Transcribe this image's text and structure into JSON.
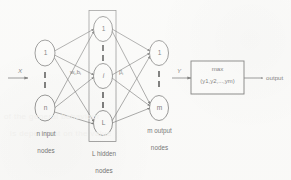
{
  "figure": {
    "background_color": "#fbfbfa",
    "stroke_color": "#2b2b2b"
  },
  "signals": {
    "input_label": "X",
    "hidden_to_output_label": "Y",
    "final_output_label": "output"
  },
  "layers": {
    "input": {
      "caption_line1": "n input",
      "caption_line2": "nodes",
      "nodes": [
        {
          "label": "1"
        },
        {
          "label": "n"
        }
      ],
      "ellipsis": "vertical-dashed"
    },
    "hidden": {
      "caption_line1": "L  hidden",
      "caption_line2": "nodes",
      "nodes": [
        {
          "label": "1"
        },
        {
          "label": "i"
        },
        {
          "label": "L"
        }
      ],
      "ellipsis": "vertical-dashed",
      "enclosure": "rectangle"
    },
    "output": {
      "caption_line1": "m output",
      "caption_line2": "nodes",
      "nodes": [
        {
          "label": "1"
        },
        {
          "label": "m"
        }
      ],
      "ellipsis": "vertical-dashed"
    }
  },
  "edge_labels": {
    "input_to_hidden_base": "w",
    "input_to_hidden_sub1": "i",
    "input_to_hidden_mid": ",b",
    "input_to_hidden_sub2": "i",
    "hidden_to_output_base": "β",
    "hidden_to_output_sub": "i"
  },
  "decision_box": {
    "operator": "max",
    "argument": "(y1,y2,...,ym)"
  },
  "ghost_text": {
    "line1": "of  the  general  behaviour",
    "line2": "is  dependent  on  the  value"
  }
}
